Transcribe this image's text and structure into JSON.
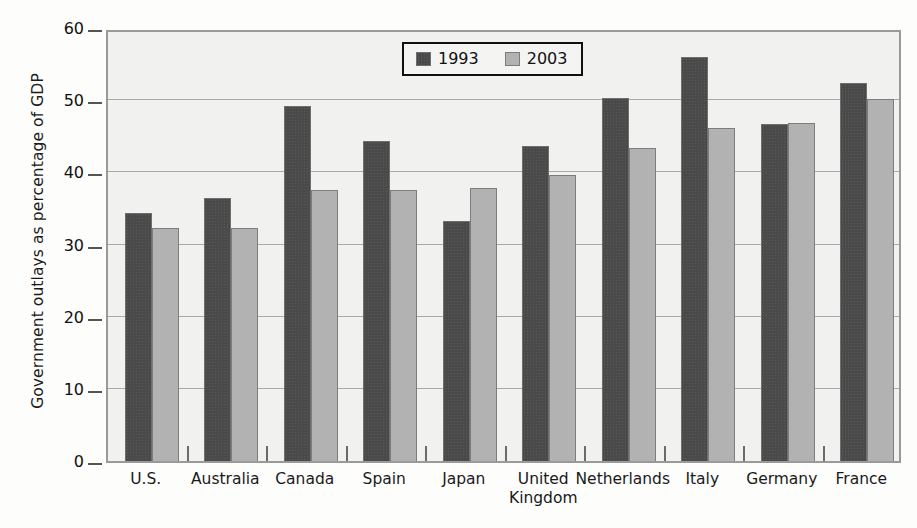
{
  "chart_data": {
    "type": "bar",
    "title": "",
    "xlabel": "",
    "ylabel": "Government outlays as percentage of GDP",
    "ylim": [
      0,
      60
    ],
    "yticks": [
      0,
      10,
      20,
      30,
      40,
      50,
      60
    ],
    "grid": true,
    "legend_position": "top-center",
    "categories": [
      "U.S.",
      "Australia",
      "Canada",
      "Spain",
      "Japan",
      "United\nKingdom",
      "Netherlands",
      "Italy",
      "Germany",
      "France"
    ],
    "series": [
      {
        "name": "1993",
        "color": "#4a4a4a",
        "values": [
          34.3,
          36.5,
          49.2,
          44.4,
          33.2,
          43.7,
          50.3,
          56.0,
          46.7,
          52.4
        ]
      },
      {
        "name": "2003",
        "color": "#b2b2b2",
        "values": [
          32.3,
          32.3,
          37.6,
          37.6,
          37.9,
          39.7,
          43.4,
          46.1,
          46.8,
          50.2
        ]
      }
    ]
  },
  "legend": {
    "items": [
      {
        "label": "1993",
        "swatch": "dark-swatch"
      },
      {
        "label": "2003",
        "swatch": "light-swatch"
      }
    ]
  }
}
